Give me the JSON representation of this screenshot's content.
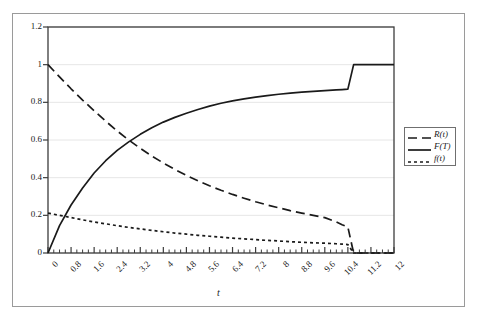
{
  "chart_data": {
    "type": "line",
    "title": "",
    "xlabel": "t",
    "ylabel": "",
    "xlim": [
      0,
      12
    ],
    "ylim": [
      0,
      1.2
    ],
    "grid": true,
    "grid_axis": "y",
    "legend_position": "right-outside",
    "x_ticks": [
      "0",
      "0.8",
      "1.6",
      "2.4",
      "3.2",
      "4",
      "4.8",
      "5.6",
      "6.4",
      "7.2",
      "8",
      "8.8",
      "9.6",
      "10.4",
      "11.2",
      "12"
    ],
    "x_tick_values": [
      0,
      0.8,
      1.6,
      2.4,
      3.2,
      4,
      4.8,
      5.6,
      6.4,
      7.2,
      8,
      8.8,
      9.6,
      10.4,
      11.2,
      12
    ],
    "x_minor_ticks_between": 3,
    "y_ticks": [
      "0",
      "0.2",
      "0.4",
      "0.6",
      "0.8",
      "1",
      "1.2"
    ],
    "y_tick_values": [
      0,
      0.2,
      0.4,
      0.6,
      0.8,
      1,
      1.2
    ],
    "series": [
      {
        "name": "R(t)",
        "style": "dashed",
        "color": "#1a1a1a",
        "x": [
          0,
          0.4,
          0.8,
          1.2,
          1.6,
          2.0,
          2.4,
          2.8,
          3.2,
          3.6,
          4.0,
          4.4,
          4.8,
          5.2,
          5.6,
          6.0,
          6.4,
          6.8,
          7.2,
          7.6,
          8.0,
          8.4,
          8.8,
          9.2,
          9.6,
          10.0,
          10.2,
          10.4,
          10.6,
          11.2,
          12.0
        ],
        "values": [
          1.0,
          0.935,
          0.872,
          0.812,
          0.755,
          0.7,
          0.648,
          0.6,
          0.556,
          0.515,
          0.478,
          0.444,
          0.412,
          0.383,
          0.357,
          0.333,
          0.311,
          0.291,
          0.272,
          0.255,
          0.24,
          0.225,
          0.212,
          0.2,
          0.188,
          0.165,
          0.15,
          0.138,
          0.0,
          0.0,
          0.0
        ]
      },
      {
        "name": "F(T)",
        "style": "solid",
        "color": "#1a1a1a",
        "x": [
          0,
          0.4,
          0.8,
          1.2,
          1.6,
          2.0,
          2.4,
          2.8,
          3.2,
          3.6,
          4.0,
          4.4,
          4.8,
          5.2,
          5.6,
          6.0,
          6.4,
          6.8,
          7.2,
          7.6,
          8.0,
          8.4,
          8.8,
          9.2,
          9.6,
          10.0,
          10.2,
          10.4,
          10.6,
          11.2,
          12.0
        ],
        "values": [
          0.0,
          0.145,
          0.255,
          0.345,
          0.425,
          0.49,
          0.545,
          0.59,
          0.63,
          0.665,
          0.695,
          0.72,
          0.742,
          0.762,
          0.78,
          0.795,
          0.808,
          0.818,
          0.828,
          0.836,
          0.843,
          0.849,
          0.854,
          0.858,
          0.862,
          0.866,
          0.868,
          0.87,
          1.0,
          1.0,
          1.0
        ]
      },
      {
        "name": "f(t)",
        "style": "dotted",
        "color": "#1a1a1a",
        "x": [
          0,
          0.4,
          0.8,
          1.2,
          1.6,
          2.0,
          2.4,
          2.8,
          3.2,
          3.6,
          4.0,
          4.4,
          4.8,
          5.2,
          5.6,
          6.0,
          6.4,
          6.8,
          7.2,
          7.6,
          8.0,
          8.4,
          8.8,
          9.2,
          9.6,
          10.0,
          10.2,
          10.4,
          10.6,
          11.2,
          12.0
        ],
        "values": [
          0.212,
          0.2,
          0.188,
          0.176,
          0.165,
          0.155,
          0.145,
          0.136,
          0.128,
          0.12,
          0.113,
          0.106,
          0.1,
          0.094,
          0.089,
          0.084,
          0.079,
          0.075,
          0.071,
          0.067,
          0.064,
          0.06,
          0.057,
          0.054,
          0.052,
          0.049,
          0.047,
          0.045,
          0.0,
          0.0,
          0.0
        ]
      }
    ],
    "legend": [
      {
        "label": "R(t)",
        "style": "dashed"
      },
      {
        "label": "F(T)",
        "style": "solid"
      },
      {
        "label": "f(t)",
        "style": "dotted"
      }
    ],
    "annotations": {
      "crossing_note": "R(t) and F(T) cross near t=3.4 at value 0.5",
      "step_note": "F(T) steps to 1.0 at t=10.6; R(t) and f(t) fall to 0 at t=10.4"
    }
  }
}
